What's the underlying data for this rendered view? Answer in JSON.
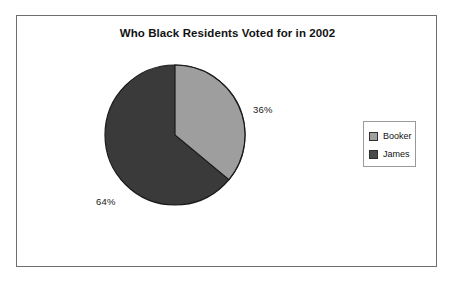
{
  "chart": {
    "title": "Who Black Residents Voted for in 2002",
    "legend": {
      "items": [
        {
          "label": "Booker",
          "color": "#a0a0a0"
        },
        {
          "label": "James",
          "color": "#4a4a4a"
        }
      ]
    },
    "labels": {
      "booker_pct": "36%",
      "james_pct": "64%"
    }
  },
  "chart_data": {
    "type": "pie",
    "title": "Who Black Residents Voted for in 2002",
    "subtitle": "",
    "xlabel": "",
    "ylabel": "",
    "categories": [
      "Booker",
      "James"
    ],
    "values": [
      36,
      64
    ],
    "value_labels": [
      "36%",
      "64%"
    ],
    "units": "percent",
    "colors": [
      "#9e9e9e",
      "#3a3a3a"
    ],
    "legend_entries": [
      "Booker",
      "James"
    ],
    "legend_position": "right",
    "grid": false,
    "start_angle_deg": 0,
    "direction": "clockwise",
    "slice_border_color": "#1a1a1a",
    "background_color": "#ffffff",
    "frame_border_color": "#6e6e6e"
  }
}
